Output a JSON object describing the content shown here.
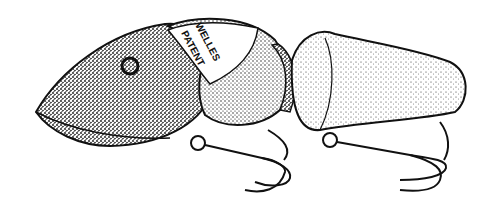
{
  "illustration": {
    "subject": "jointed fishing lure with two treble hooks",
    "style": "black and white stipple drawing",
    "imprint_line1": "WELLES",
    "imprint_line2": "PATENT",
    "colors": {
      "ink": "#111111",
      "background": "#ffffff",
      "stipple_dark": "#3a3a3a",
      "stipple_light": "#9a9a9a"
    }
  }
}
